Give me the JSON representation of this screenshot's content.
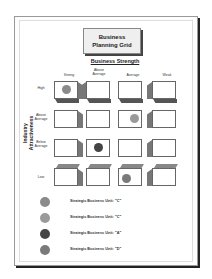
{
  "title": "Business Planning Grid",
  "title_lines": [
    "Business",
    "Planning Grid"
  ],
  "x_axis": {
    "title": "Business Strength",
    "columns": [
      {
        "label": "Strong"
      },
      {
        "label": "Above Average",
        "lines": [
          "Above",
          "Average"
        ]
      },
      {
        "label": "Average"
      },
      {
        "label": "Weak"
      }
    ]
  },
  "y_axis": {
    "title": "Industry Attractiveness",
    "title_lines": [
      "Industry",
      "Attractiveness"
    ],
    "rows": [
      {
        "label": "High",
        "lines": [
          "High"
        ]
      },
      {
        "label": "Above Average",
        "lines": [
          "Above",
          "Average"
        ]
      },
      {
        "label": "Below Average",
        "lines": [
          "Below",
          "Average"
        ]
      },
      {
        "label": "Low",
        "lines": [
          "Low"
        ]
      }
    ]
  },
  "placements": [
    {
      "row": 0,
      "col": 0,
      "unit": "C",
      "color": "#8a8a8a"
    },
    {
      "row": 1,
      "col": 2,
      "unit": "C",
      "color": "#9a9a9a"
    },
    {
      "row": 2,
      "col": 1,
      "unit": "A",
      "color": "#444444"
    },
    {
      "row": 3,
      "col": 2,
      "unit": "D",
      "color": "#7a7a7a"
    }
  ],
  "legend": [
    {
      "label": "Strategic Business Unit: \"C\"",
      "color": "#8a8a8a"
    },
    {
      "label": "Strategic Business Unit: \"C\"",
      "color": "#9a9a9a"
    },
    {
      "label": "Strategic Business Unit: \"A\"",
      "color": "#444444"
    },
    {
      "label": "Strategic Business Unit: \"D\"",
      "color": "#7a7a7a"
    }
  ]
}
